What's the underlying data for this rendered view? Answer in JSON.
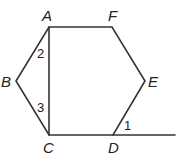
{
  "diagram": {
    "type": "hexagon-geometry",
    "stroke_color": "#333333",
    "vertices": [
      {
        "id": "A",
        "label": "A",
        "x": 49,
        "y": 27,
        "lx": 42,
        "ly": 21
      },
      {
        "id": "F",
        "label": "F",
        "x": 112,
        "y": 27,
        "lx": 108,
        "ly": 21
      },
      {
        "id": "E",
        "label": "E",
        "x": 145,
        "y": 81,
        "lx": 148,
        "ly": 87
      },
      {
        "id": "D",
        "label": "D",
        "x": 113,
        "y": 135,
        "lx": 108,
        "ly": 153
      },
      {
        "id": "C",
        "label": "C",
        "x": 49,
        "y": 135,
        "lx": 43,
        "ly": 153
      },
      {
        "id": "B",
        "label": "B",
        "x": 16,
        "y": 81,
        "lx": 1,
        "ly": 87
      }
    ],
    "angles": [
      {
        "label": "2",
        "x": 37,
        "y": 58
      },
      {
        "label": "3",
        "x": 37,
        "y": 112
      },
      {
        "label": "1",
        "x": 124,
        "y": 130
      }
    ],
    "extension_line": {
      "from": "D",
      "x2": 175,
      "y2": 135
    }
  }
}
